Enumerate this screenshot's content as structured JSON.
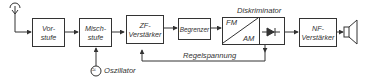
{
  "diagram": {
    "blocks": [
      {
        "id": "vorstufe",
        "label_line1": "Vor-",
        "label_line2": "stufe"
      },
      {
        "id": "mischstufe",
        "label_line1": "Misch-",
        "label_line2": "stufe"
      },
      {
        "id": "zf_verstaerker",
        "label_line1": "ZF-",
        "label_line2": "Verstärker"
      },
      {
        "id": "begrenzer",
        "label_line1": "Begrenzer"
      },
      {
        "id": "diskriminator",
        "fm_label": "FM",
        "am_label": "AM",
        "caption": "Diskriminator"
      },
      {
        "id": "nf_verstaerker",
        "label_line1": "NF-",
        "label_line2": "Verstärker"
      }
    ],
    "oscillator": {
      "symbol": "≈",
      "label": "Oszillator"
    },
    "feedback": {
      "label": "Regelspannung"
    },
    "icons": [
      "antenna-icon",
      "diode-icon",
      "loudspeaker-icon",
      "oscillator-icon"
    ],
    "line_color": "#333333"
  }
}
